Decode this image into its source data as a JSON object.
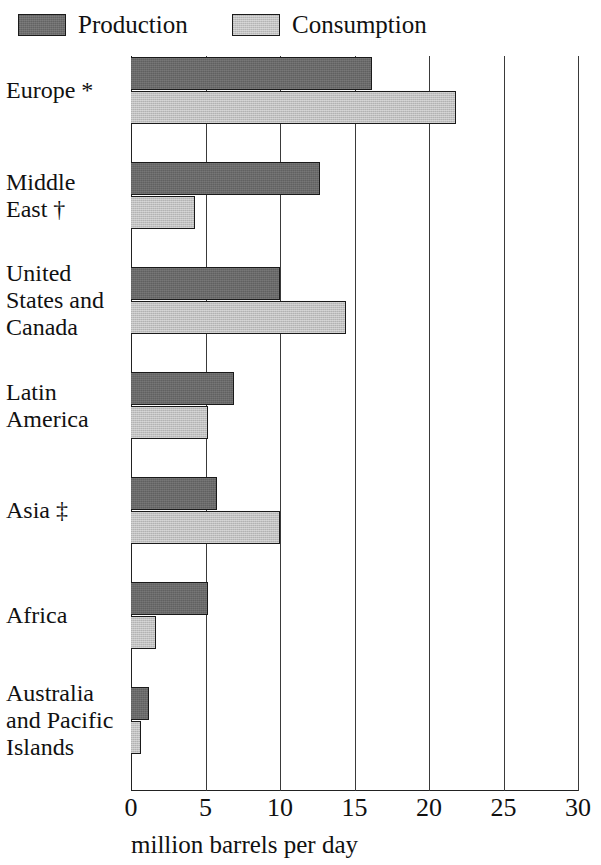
{
  "legend": {
    "items": [
      {
        "key": "production",
        "label": "Production",
        "color": "#6a6a6a"
      },
      {
        "key": "consumption",
        "label": "Consumption",
        "color": "#c0c0c0"
      }
    ]
  },
  "axis": {
    "title": "million barrels per day",
    "ticks": [
      "0",
      "5",
      "10",
      "15",
      "20",
      "25",
      "30"
    ]
  },
  "chart_data": {
    "type": "bar",
    "orientation": "horizontal",
    "title": "",
    "subtitle": "",
    "xlabel": "million barrels per day",
    "ylabel": "",
    "xlim": [
      0,
      30
    ],
    "xticks": [
      0,
      5,
      10,
      15,
      20,
      25,
      30
    ],
    "grid": true,
    "legend_position": "top",
    "units": "million barrels per day",
    "categories": [
      "Europe *",
      "Middle\nEast †",
      "United\nStates and\nCanada",
      "Latin\nAmerica",
      "Asia ‡",
      "Africa",
      "Australia\nand Pacific\nIslands"
    ],
    "series": [
      {
        "name": "Production",
        "color": "#6a6a6a",
        "values": [
          16.2,
          12.7,
          10.0,
          6.9,
          5.8,
          5.2,
          1.2
        ]
      },
      {
        "name": "Consumption",
        "color": "#c0c0c0",
        "values": [
          21.8,
          4.3,
          14.4,
          5.2,
          10.0,
          1.7,
          0.7
        ]
      }
    ],
    "annotations": [
      "* footnote marker on Europe",
      "† footnote marker on Middle East",
      "‡ footnote marker on Asia"
    ]
  },
  "rows": [
    {
      "label": "Europe *",
      "label_lines": [
        "Europe *"
      ],
      "production": 16.2,
      "consumption": 21.8
    },
    {
      "label": "Middle East †",
      "label_lines": [
        "Middle",
        "East †"
      ],
      "production": 12.7,
      "consumption": 4.3
    },
    {
      "label": "United States and Canada",
      "label_lines": [
        "United",
        "States and",
        "Canada"
      ],
      "production": 10.0,
      "consumption": 14.4
    },
    {
      "label": "Latin America",
      "label_lines": [
        "Latin",
        "America"
      ],
      "production": 6.9,
      "consumption": 5.2
    },
    {
      "label": "Asia ‡",
      "label_lines": [
        "Asia ‡"
      ],
      "production": 5.8,
      "consumption": 10.0
    },
    {
      "label": "Africa",
      "label_lines": [
        "Africa"
      ],
      "production": 5.2,
      "consumption": 1.7
    },
    {
      "label": "Australia and Pacific Islands",
      "label_lines": [
        "Australia",
        "and Pacific",
        "Islands"
      ],
      "production": 1.2,
      "consumption": 0.7
    }
  ]
}
